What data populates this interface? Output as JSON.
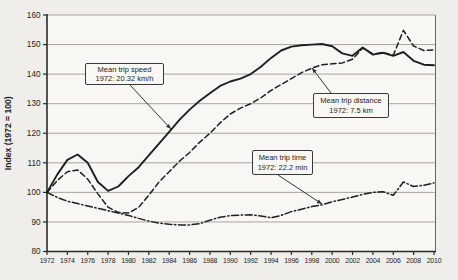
{
  "figure": {
    "background": "#efeeeb",
    "plot_background": "#f8f7f4",
    "line_color": "#1f1f1f",
    "grid_color": "#a9a59f",
    "axis_color": "#2a2a2a"
  },
  "chart_data": {
    "type": "line",
    "title": "",
    "xlabel": "",
    "ylabel": "Index (1972 = 100)",
    "xlim": [
      1972,
      2010
    ],
    "ylim": [
      80,
      160
    ],
    "xticks": [
      1972,
      1974,
      1976,
      1978,
      1980,
      1982,
      1984,
      1986,
      1988,
      1990,
      1992,
      1994,
      1996,
      1998,
      2000,
      2002,
      2004,
      2006,
      2008,
      2010
    ],
    "yticks": [
      80,
      90,
      100,
      110,
      120,
      130,
      140,
      150,
      160
    ],
    "grid": "horizontal",
    "legend_position": "none",
    "x": [
      1972,
      1973,
      1974,
      1975,
      1976,
      1977,
      1978,
      1979,
      1980,
      1981,
      1982,
      1983,
      1984,
      1985,
      1986,
      1987,
      1988,
      1989,
      1990,
      1991,
      1992,
      1993,
      1994,
      1995,
      1996,
      1997,
      1998,
      1999,
      2000,
      2001,
      2002,
      2003,
      2004,
      2005,
      2006,
      2007,
      2008,
      2009,
      2010
    ],
    "series": [
      {
        "name": "Mean trip speed",
        "style": "solid",
        "values": [
          100,
          106,
          111,
          112.8,
          110,
          103.5,
          100.5,
          102,
          105.5,
          108.5,
          112.5,
          116.5,
          120.5,
          124.5,
          128,
          131,
          133.5,
          136,
          137.5,
          138.5,
          140,
          142.5,
          145.5,
          148,
          149.3,
          149.8,
          150,
          150.2,
          149.4,
          147,
          146.2,
          149,
          146.6,
          147.2,
          146.2,
          147.5,
          144.5,
          143.2,
          143
        ]
      },
      {
        "name": "Mean trip distance",
        "style": "dashed",
        "values": [
          100,
          104,
          107,
          107.6,
          104.5,
          99.5,
          95,
          93.2,
          93,
          95,
          99,
          103.5,
          107,
          110.5,
          113.5,
          117,
          120,
          123.5,
          126.5,
          128.5,
          130,
          132,
          134.5,
          136.5,
          138.5,
          140.5,
          142,
          143.2,
          143.5,
          143.8,
          145,
          148.8,
          146.8,
          147.3,
          146.4,
          154.8,
          149.5,
          148,
          148.2
        ]
      },
      {
        "name": "Mean trip time",
        "style": "dashdot",
        "values": [
          100,
          98.3,
          97,
          96.2,
          95.4,
          94.6,
          93.8,
          93,
          92.2,
          91.2,
          90.3,
          89.6,
          89.2,
          89,
          89,
          89.4,
          90.6,
          91.6,
          92.1,
          92.3,
          92.4,
          92,
          91.4,
          92.2,
          93.5,
          94.3,
          95.2,
          95.8,
          96.8,
          97.6,
          98.4,
          99.3,
          100,
          100.2,
          99,
          103.5,
          102,
          102.4,
          103.2
        ]
      }
    ],
    "annotations": [
      {
        "id": "speed",
        "line1": "Mean trip speed",
        "line2": "1972: 20.32 km/h",
        "box": {
          "x": 85,
          "y": 63,
          "w": 79,
          "h": 22
        },
        "leader": {
          "x1": 130,
          "y1": 85,
          "x2": 171,
          "y2": 129
        },
        "arrow": true
      },
      {
        "id": "distance",
        "line1": "Mean trip distance",
        "line2": "1972: 7.5 km",
        "box": {
          "x": 313,
          "y": 93,
          "w": 76,
          "h": 25
        },
        "leader": {
          "x1": 331,
          "y1": 93,
          "x2": 312,
          "y2": 68
        },
        "arrow": true
      },
      {
        "id": "time",
        "line1": "Mean trip time",
        "line2": "1972: 22.2 min",
        "box": {
          "x": 252,
          "y": 150,
          "w": 61,
          "h": 25
        },
        "leader": {
          "x1": 278,
          "y1": 175,
          "x2": 322,
          "y2": 204
        },
        "arrow": true
      }
    ]
  }
}
